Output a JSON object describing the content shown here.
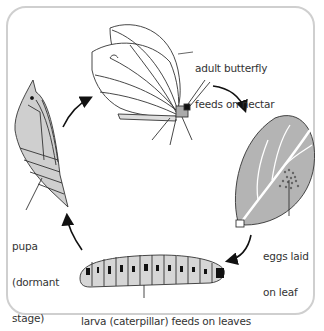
{
  "stages": [
    {
      "id": "adult",
      "label_line1": "adult butterfly",
      "label_line2": "feeds on nectar"
    },
    {
      "id": "eggs",
      "label_line1": "eggs laid",
      "label_line2": "on leaf"
    },
    {
      "id": "larva",
      "label_line1": "larva (caterpillar) feeds on leaves"
    },
    {
      "id": "pupa",
      "label_line1": "pupa",
      "label_line2": "(dormant",
      "label_line3": "stage)"
    }
  ],
  "cycle_order": [
    "adult",
    "eggs",
    "larva",
    "pupa"
  ],
  "colors": {
    "frame": "#cfcfcf",
    "fill_gray": "#c8c8c8",
    "leaf_gray": "#b4b4b4",
    "line": "#222222",
    "text": "#333333"
  }
}
